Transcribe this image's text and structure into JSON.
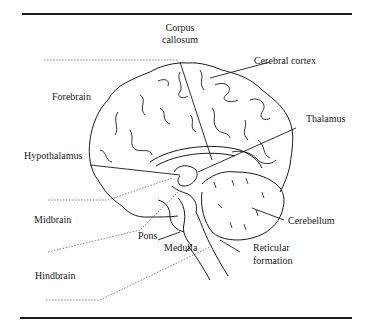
{
  "diagram": {
    "type": "anatomical-labeled-illustration",
    "labels": {
      "corpus_callosum_1": "Corpus",
      "corpus_callosum_2": "callosum",
      "cerebral_cortex": "Cerebral cortex",
      "forebrain": "Forebrain",
      "thalamus": "Thalamus",
      "hypothalamus": "Hypothalamus",
      "midbrain": "Midbrain",
      "cerebellum": "Cerebellum",
      "pons": "Pons",
      "medulla": "Medulla",
      "reticular_1": "Reticular",
      "reticular_2": "formation",
      "hindbrain": "Hindbrain"
    },
    "colors": {
      "ink": "#1a1a1a",
      "dotted": "#555555",
      "background": "#ffffff"
    }
  }
}
